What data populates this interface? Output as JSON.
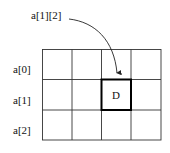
{
  "diagram": {
    "pointer_label": "a[1][2]",
    "row_labels": [
      "a[0]",
      "a[1]",
      "a[2]"
    ],
    "rows": 3,
    "cols": 4,
    "highlight": {
      "row": 1,
      "col": 2,
      "text": "D"
    },
    "colors": {
      "line": "#222222",
      "highlight_border": "#000000",
      "background": "#ffffff"
    }
  }
}
